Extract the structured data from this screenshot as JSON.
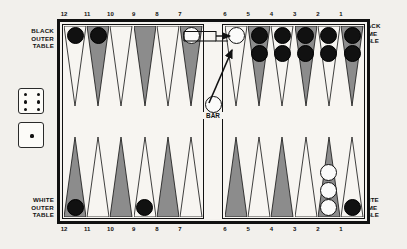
{
  "board": {
    "title": "Backgammon board diagram",
    "quadrant_labels": {
      "black_outer": "BLACK\nOUTER\nTABLE",
      "black_home": "BLACK\nHOME\nTABLE",
      "white_outer": "WHITE\nOUTER\nTABLE",
      "white_home": "WHITE\nHOME\nTABLE"
    },
    "bar_label": "BAR",
    "colors": {
      "point_shaded": "#8c8c8c",
      "point_plain": "#f7f5f1",
      "checker_black": "#111111",
      "checker_white": "#fbfbfa",
      "frame": "#111111",
      "felt": "#f7f5f1",
      "page_background": "#f2f0ec"
    },
    "top_numbers": [
      "12",
      "11",
      "10",
      "9",
      "8",
      "7",
      "6",
      "5",
      "4",
      "3",
      "2",
      "1"
    ],
    "bottom_numbers": [
      "12",
      "11",
      "10",
      "9",
      "8",
      "7",
      "6",
      "5",
      "4",
      "3",
      "2",
      "1"
    ]
  },
  "dice": [
    {
      "name": "die-six",
      "value": 6,
      "pips": 6
    },
    {
      "name": "die-one",
      "value": 1,
      "pips": 1
    }
  ],
  "points": {
    "top_left": [
      {
        "number": "12",
        "shade": "plain",
        "checkers": 1,
        "color": "black"
      },
      {
        "number": "11",
        "shade": "shaded",
        "checkers": 1,
        "color": "black"
      },
      {
        "number": "10",
        "shade": "plain",
        "checkers": 0,
        "color": ""
      },
      {
        "number": "9",
        "shade": "shaded",
        "checkers": 0,
        "color": ""
      },
      {
        "number": "8",
        "shade": "plain",
        "checkers": 0,
        "color": ""
      },
      {
        "number": "7",
        "shade": "shaded",
        "checkers": 1,
        "color": "white"
      }
    ],
    "top_right": [
      {
        "number": "6",
        "shade": "plain",
        "checkers": 1,
        "color": "white"
      },
      {
        "number": "5",
        "shade": "shaded",
        "checkers": 2,
        "color": "black"
      },
      {
        "number": "4",
        "shade": "plain",
        "checkers": 2,
        "color": "black"
      },
      {
        "number": "3",
        "shade": "shaded",
        "checkers": 2,
        "color": "black"
      },
      {
        "number": "2",
        "shade": "plain",
        "checkers": 2,
        "color": "black"
      },
      {
        "number": "1",
        "shade": "shaded",
        "checkers": 2,
        "color": "black"
      }
    ],
    "bottom_left": [
      {
        "number": "12",
        "shade": "shaded",
        "checkers": 1,
        "color": "black"
      },
      {
        "number": "11",
        "shade": "plain",
        "checkers": 0,
        "color": ""
      },
      {
        "number": "10",
        "shade": "shaded",
        "checkers": 0,
        "color": ""
      },
      {
        "number": "9",
        "shade": "plain",
        "checkers": 1,
        "color": "black"
      },
      {
        "number": "8",
        "shade": "shaded",
        "checkers": 0,
        "color": ""
      },
      {
        "number": "7",
        "shade": "plain",
        "checkers": 0,
        "color": ""
      }
    ],
    "bottom_right": [
      {
        "number": "6",
        "shade": "shaded",
        "checkers": 0,
        "color": ""
      },
      {
        "number": "5",
        "shade": "plain",
        "checkers": 0,
        "color": ""
      },
      {
        "number": "4",
        "shade": "shaded",
        "checkers": 0,
        "color": ""
      },
      {
        "number": "3",
        "shade": "plain",
        "checkers": 0,
        "color": ""
      },
      {
        "number": "2",
        "shade": "shaded",
        "checkers": 3,
        "color": "white"
      },
      {
        "number": "1",
        "shade": "plain",
        "checkers": 1,
        "color": "black"
      }
    ]
  },
  "bar_checkers": [
    {
      "color": "white",
      "count": 1
    }
  ],
  "move_arrows": [
    {
      "name": "arrow-point7-to-point6",
      "from": "7",
      "to": "6"
    },
    {
      "name": "arrow-bar-to-point6",
      "from": "BAR",
      "to": "6"
    }
  ]
}
